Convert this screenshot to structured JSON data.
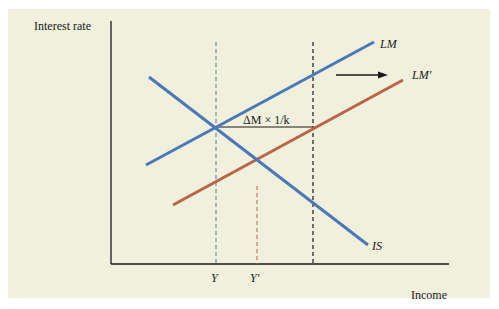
{
  "figure": {
    "y_axis_label": "Interest rate",
    "x_axis_label": "Income",
    "curves": {
      "lm": {
        "label": "LM",
        "color": "#4a78b8"
      },
      "lm_prime": {
        "label": "LM′",
        "color": "#b86548"
      },
      "is": {
        "label": "IS",
        "color": "#4a78b8"
      }
    },
    "annotation": "ΔM × 1/k",
    "x_ticks": [
      "Y",
      "Y′"
    ],
    "colors": {
      "background": "#f0f0dc",
      "axis": "#1a1a1a",
      "blue": "#4a78b8",
      "red": "#b86548"
    }
  }
}
